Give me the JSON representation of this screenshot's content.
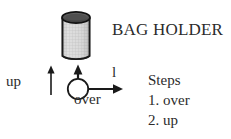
{
  "figure": {
    "title": "BAG HOLDER",
    "labels": {
      "up": "up",
      "over": "over",
      "length": "l"
    },
    "steps": {
      "heading": "Steps",
      "items": [
        "1. over",
        "2. up"
      ]
    },
    "colors": {
      "text": "#2b2b2b",
      "outline": "#1a1a1a",
      "cylinder_top": "#4a4a4a",
      "cylinder_body": "#d8d8d8",
      "cylinder_mesh": "#9a9a9a",
      "background": "#ffffff"
    },
    "icons": {
      "cylinder": "cylinder-bag-holder",
      "up_arrow": "up-arrow-icon",
      "over_arrow": "right-arrow-icon",
      "origin": "origin-circle-icon",
      "vertical_axis_arrow": "vertical-axis-arrow-icon"
    }
  }
}
